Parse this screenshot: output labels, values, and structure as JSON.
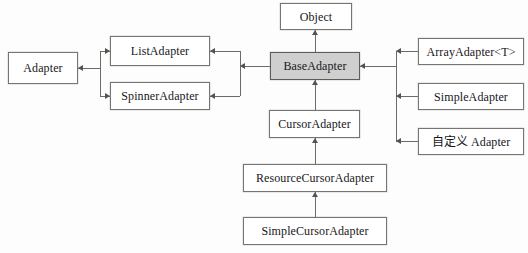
{
  "diagram": {
    "type": "class-inheritance",
    "background_color": "#fdfdfd",
    "line_color": "#6d6a67",
    "node_border_color": "#777471",
    "highlight_fill": "#cfcfcf",
    "nodes": [
      {
        "id": "object",
        "label": "Object",
        "x": 280,
        "y": 3,
        "w": 72,
        "h": 27,
        "fill": "white"
      },
      {
        "id": "base-adapter",
        "label": "BaseAdapter",
        "x": 270,
        "y": 52,
        "w": 90,
        "h": 28,
        "fill": "shaded"
      },
      {
        "id": "adapter",
        "label": "Adapter",
        "x": 8,
        "y": 52,
        "w": 70,
        "h": 32,
        "fill": "white"
      },
      {
        "id": "list-adapter",
        "label": "ListAdapter",
        "x": 110,
        "y": 36,
        "w": 100,
        "h": 30,
        "fill": "white"
      },
      {
        "id": "spinner-adapter",
        "label": "SpinnerAdapter",
        "x": 110,
        "y": 82,
        "w": 100,
        "h": 28,
        "fill": "white"
      },
      {
        "id": "array-adapter",
        "label": "ArrayAdapter<T>",
        "x": 418,
        "y": 38,
        "w": 106,
        "h": 27,
        "fill": "white"
      },
      {
        "id": "simple-adapter",
        "label": "SimpleAdapter",
        "x": 418,
        "y": 83,
        "w": 106,
        "h": 27,
        "fill": "white"
      },
      {
        "id": "custom-adapter",
        "label": "自定义 Adapter",
        "x": 418,
        "y": 128,
        "w": 106,
        "h": 27,
        "fill": "white"
      },
      {
        "id": "cursor-adapter",
        "label": "CursorAdapter",
        "x": 269,
        "y": 110,
        "w": 91,
        "h": 28,
        "fill": "white"
      },
      {
        "id": "resource-cursor-adapter",
        "label": "ResourceCursorAdapter",
        "x": 243,
        "y": 164,
        "w": 144,
        "h": 28,
        "fill": "white"
      },
      {
        "id": "simple-cursor-adapter",
        "label": "SimpleCursorAdapter",
        "x": 243,
        "y": 217,
        "w": 144,
        "h": 28,
        "fill": "white"
      }
    ],
    "edges": [
      {
        "id": "base-to-object",
        "from": "base-adapter",
        "to": "object",
        "arrow": "up"
      },
      {
        "id": "cursor-to-base",
        "from": "cursor-adapter",
        "to": "base-adapter",
        "arrow": "up"
      },
      {
        "id": "resource-to-cursor",
        "from": "resource-cursor-adapter",
        "to": "cursor-adapter",
        "arrow": "up"
      },
      {
        "id": "simple-cursor-to-resource",
        "from": "simple-cursor-adapter",
        "to": "resource-cursor-adapter",
        "arrow": "up"
      },
      {
        "id": "list-to-adapter",
        "from": "list-adapter",
        "to": "adapter",
        "arrow": "left"
      },
      {
        "id": "spinner-to-adapter",
        "from": "spinner-adapter",
        "to": "adapter",
        "arrow": "left"
      },
      {
        "id": "base-to-list",
        "from": "base-adapter",
        "to": "list-adapter",
        "arrow": "left"
      },
      {
        "id": "base-to-spinner",
        "from": "base-adapter",
        "to": "spinner-adapter",
        "arrow": "left"
      },
      {
        "id": "array-to-base",
        "from": "array-adapter",
        "to": "base-adapter",
        "arrow": "left"
      },
      {
        "id": "simple-to-base",
        "from": "simple-adapter",
        "to": "base-adapter",
        "arrow": "left"
      },
      {
        "id": "custom-to-base",
        "from": "custom-adapter",
        "to": "base-adapter",
        "arrow": "left"
      }
    ]
  }
}
